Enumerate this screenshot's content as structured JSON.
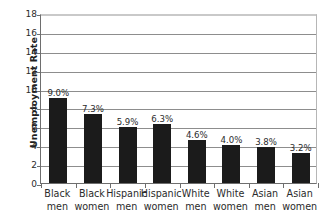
{
  "chart_data": {
    "type": "bar",
    "title": "",
    "xlabel": "",
    "ylabel": "Unemployment Rate",
    "ylim": [
      0,
      18
    ],
    "ytick_step": 2,
    "yticks": [
      0,
      2,
      4,
      6,
      8,
      10,
      12,
      14,
      16,
      18
    ],
    "grid": true,
    "legend": false,
    "categories": [
      "Black men",
      "Black women",
      "Hispanic men",
      "Hispanic women",
      "White men",
      "White women",
      "Asian men",
      "Asian women"
    ],
    "category_lines": [
      [
        "Black",
        "men"
      ],
      [
        "Black",
        "women"
      ],
      [
        "Hispanic",
        "men"
      ],
      [
        "Hispanic",
        "women"
      ],
      [
        "White",
        "men"
      ],
      [
        "White",
        "women"
      ],
      [
        "Asian",
        "men"
      ],
      [
        "Asian",
        "women"
      ]
    ],
    "values": [
      9.0,
      7.3,
      5.9,
      6.3,
      4.6,
      4.0,
      3.8,
      3.2
    ],
    "data_labels": [
      "9.0%",
      "7.3%",
      "5.9%",
      "6.3%",
      "4.6%",
      "4.0%",
      "3.8%",
      "3.2%"
    ],
    "bar_color": "#1b1b1b",
    "gridline_color": "#8d8d8d",
    "axis_color": "#6e6e6e",
    "background_color": "#ffffff"
  }
}
